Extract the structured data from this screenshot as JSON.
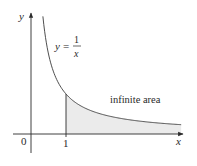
{
  "diagram": {
    "function_label": {
      "lhs": "y",
      "eq": "=",
      "numerator": "1",
      "denominator": "x"
    },
    "region_label": "infinite area",
    "axes": {
      "x_label": "x",
      "y_label": "y",
      "origin_label": "0",
      "tick_label": "1"
    },
    "colors": {
      "curve": "#3a3a3a",
      "axis": "#2a2a2a",
      "shade": "#ebebeb"
    }
  },
  "chart_data": {
    "type": "area",
    "title": "",
    "function": "y = 1/x",
    "shaded_region": {
      "x_from": 1,
      "x_to": "infinity",
      "label": "infinite area"
    },
    "x_ticks": [
      "0",
      "1"
    ],
    "xlabel": "x",
    "ylabel": "y",
    "curve_domain": [
      0.34,
      4.29
    ]
  }
}
